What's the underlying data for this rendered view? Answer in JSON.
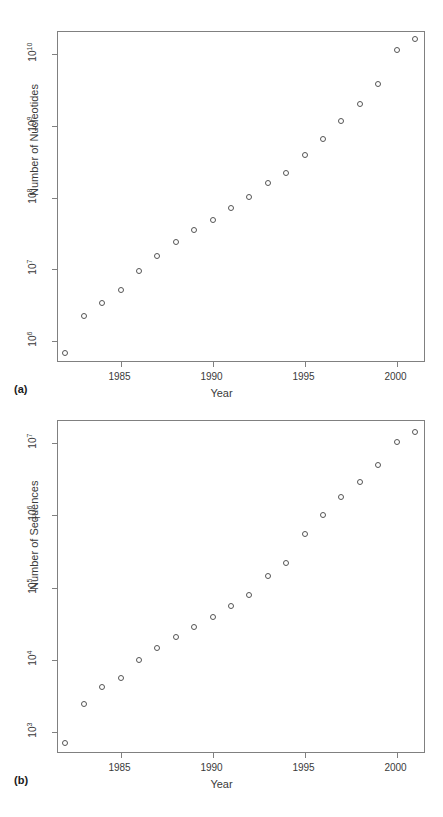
{
  "figure": {
    "panels": [
      {
        "id": "a",
        "label": "(a)",
        "chart_ref": 0
      },
      {
        "id": "b",
        "label": "(b)",
        "chart_ref": 1
      }
    ]
  },
  "chart_data": [
    {
      "type": "scatter",
      "title": "",
      "xlabel": "Year",
      "ylabel": "Number of Nucleotides",
      "xlim": [
        1981.6,
        2001.6
      ],
      "ylim": [
        500000,
        20000000000
      ],
      "yscale": "log",
      "xscale": "linear",
      "grid": false,
      "legend": "none",
      "xticks": [
        1985,
        1990,
        1995,
        2000
      ],
      "xtick_labels": [
        "1985",
        "1990",
        "1995",
        "2000"
      ],
      "yticks": [
        1000000,
        10000000,
        100000000,
        1000000000,
        10000000000
      ],
      "ytick_labels": [
        "10^6",
        "10^7",
        "10^8",
        "10^9",
        "10^10"
      ],
      "ytick_mantissa": [
        "10",
        "10",
        "10",
        "10",
        "10"
      ],
      "ytick_exponent": [
        "6",
        "7",
        "8",
        "9",
        "10"
      ],
      "x": [
        1982,
        1983,
        1984,
        1985,
        1986,
        1987,
        1988,
        1989,
        1990,
        1991,
        1992,
        1993,
        1994,
        1995,
        1996,
        1997,
        1998,
        1999,
        2000,
        2001
      ],
      "values": [
        680000,
        2270000,
        3370000,
        5200000,
        9600000,
        15500000,
        23800000,
        35300000,
        49200000,
        71900000,
        101000000,
        157000000,
        217000000,
        384000000,
        651000000,
        1160000000,
        2010000000,
        3840000000,
        11100000000,
        15800000000
      ],
      "marker": "open-circle",
      "marker_color": "#555555"
    },
    {
      "type": "scatter",
      "title": "",
      "xlabel": "Year",
      "ylabel": "Number of Sequences",
      "xlim": [
        1981.6,
        2001.6
      ],
      "ylim": [
        500,
        20000000
      ],
      "yscale": "log",
      "xscale": "linear",
      "grid": false,
      "legend": "none",
      "xticks": [
        1985,
        1990,
        1995,
        2000
      ],
      "xtick_labels": [
        "1985",
        "1990",
        "1995",
        "2000"
      ],
      "yticks": [
        1000,
        10000,
        100000,
        1000000,
        10000000
      ],
      "ytick_labels": [
        "10^3",
        "10^4",
        "10^5",
        "10^6",
        "10^7"
      ],
      "ytick_mantissa": [
        "10",
        "10",
        "10",
        "10",
        "10"
      ],
      "ytick_exponent": [
        "3",
        "4",
        "5",
        "6",
        "7"
      ],
      "x": [
        1982,
        1983,
        1984,
        1985,
        1986,
        1987,
        1988,
        1989,
        1990,
        1991,
        1992,
        1993,
        1994,
        1995,
        1996,
        1997,
        1998,
        1999,
        2000,
        2001
      ],
      "values": [
        700,
        2430,
        4170,
        5700,
        9980,
        14580,
        20580,
        28790,
        39530,
        55630,
        78600,
        143500,
        215300,
        555000,
        1020000,
        1760000,
        2840000,
        4860000,
        10100000,
        14000000
      ],
      "marker": "open-circle",
      "marker_color": "#555555"
    }
  ]
}
